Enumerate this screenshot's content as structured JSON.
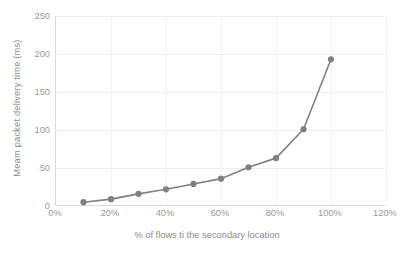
{
  "chart_data": {
    "type": "line",
    "title": "",
    "xlabel": "% of flows ti the secondary location",
    "ylabel": "Meam packet delivery time (ms)",
    "x": [
      10,
      20,
      30,
      40,
      50,
      60,
      70,
      80,
      90,
      100
    ],
    "values": [
      5,
      9,
      16,
      22,
      29,
      36,
      51,
      63,
      101,
      193
    ],
    "series": [
      {
        "name": "Mean packet delivery time",
        "values": [
          5,
          9,
          16,
          22,
          29,
          36,
          51,
          63,
          101,
          193
        ]
      }
    ],
    "xlim": [
      0,
      120
    ],
    "ylim": [
      0,
      250
    ],
    "x_tick_labels": [
      "0%",
      "20%",
      "40%",
      "60%",
      "80%",
      "100%",
      "120%"
    ],
    "x_tick_values": [
      0,
      20,
      40,
      60,
      80,
      100,
      120
    ],
    "y_tick_labels": [
      "0",
      "50",
      "100",
      "150",
      "200",
      "250"
    ],
    "y_tick_values": [
      0,
      50,
      100,
      150,
      200,
      250
    ],
    "grid": "horizontal-and-vertical",
    "legend": "none",
    "series_color": "#808080",
    "marker": "circle",
    "gridline_color": "#ededed",
    "axis_color": "#d9d9d9",
    "tick_label_color": "#9a9a9a",
    "axis_title_color": "#8c8c8c",
    "background_color": "#ffffff"
  }
}
